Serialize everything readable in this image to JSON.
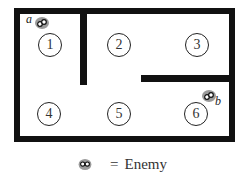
{
  "map": {
    "rooms": [
      {
        "label": "1"
      },
      {
        "label": "2"
      },
      {
        "label": "3"
      },
      {
        "label": "4"
      },
      {
        "label": "5"
      },
      {
        "label": "6"
      }
    ],
    "enemies": [
      {
        "label": "a"
      },
      {
        "label": "b"
      }
    ]
  },
  "legend": {
    "icon": "enemy-icon",
    "equals": "=",
    "text": "Enemy"
  },
  "colors": {
    "wall": "#111111",
    "enemy": "#9a9a9a"
  }
}
